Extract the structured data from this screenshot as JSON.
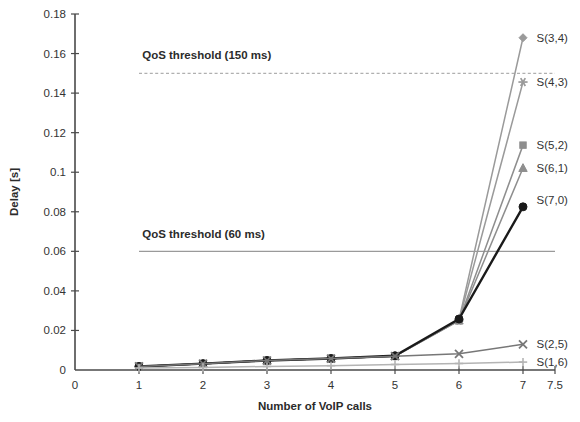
{
  "chart_data": {
    "type": "line",
    "title": "",
    "xlabel": "Number of VoIP calls",
    "ylabel": "Delay [s]",
    "x": [
      1,
      2,
      3,
      4,
      5,
      6,
      7
    ],
    "xlim": [
      0,
      7.5
    ],
    "ylim": [
      0,
      0.18
    ],
    "xticks": [
      "0",
      "1",
      "2",
      "3",
      "4",
      "5",
      "6",
      "7",
      "7.5"
    ],
    "xtick_values": [
      0,
      1,
      2,
      3,
      4,
      5,
      6,
      7,
      7.5
    ],
    "yticks": [
      "0",
      "0.02",
      "0.04",
      "0.06",
      "0.08",
      "0.1",
      "0.12",
      "0.14",
      "0.16",
      "0.18"
    ],
    "ytick_values": [
      0,
      0.02,
      0.04,
      0.06,
      0.08,
      0.1,
      0.12,
      0.14,
      0.16,
      0.18
    ],
    "grid": false,
    "legend_position": "right-inline-labels",
    "series": [
      {
        "name": "S(3,4)",
        "marker": "diamond",
        "color": "#9a9a9a",
        "label_x": 7.15,
        "label_y": 0.168,
        "values": [
          0.0018,
          0.0032,
          0.0048,
          0.0058,
          0.007,
          0.0255,
          0.168
        ]
      },
      {
        "name": "S(4,3)",
        "marker": "star",
        "color": "#9a9a9a",
        "label_x": 7.15,
        "label_y": 0.1456,
        "values": [
          0.0018,
          0.0032,
          0.0048,
          0.0058,
          0.007,
          0.025,
          0.1456
        ]
      },
      {
        "name": "S(5,2)",
        "marker": "square",
        "color": "#8e8e8e",
        "label_x": 7.15,
        "label_y": 0.1137,
        "values": [
          0.0018,
          0.0032,
          0.0048,
          0.0058,
          0.007,
          0.025,
          0.1137
        ]
      },
      {
        "name": "S(6,1)",
        "marker": "triangle",
        "color": "#8e8e8e",
        "label_x": 7.15,
        "label_y": 0.1021,
        "values": [
          0.0018,
          0.0032,
          0.0048,
          0.0058,
          0.007,
          0.025,
          0.1021
        ]
      },
      {
        "name": "S(7,0)",
        "marker": "circle",
        "color": "#1a1a1a",
        "label_x": 7.15,
        "label_y": 0.086,
        "values": [
          0.0018,
          0.0032,
          0.0048,
          0.0058,
          0.0072,
          0.0258,
          0.0825
        ]
      },
      {
        "name": "S(2,5)",
        "marker": "cross",
        "color": "#777777",
        "label_x": 7.15,
        "label_y": 0.013,
        "values": [
          0.0018,
          0.0032,
          0.0048,
          0.0058,
          0.007,
          0.0082,
          0.013
        ]
      },
      {
        "name": "S(1,6)",
        "marker": "plus",
        "color": "#b4b4b4",
        "label_x": 7.15,
        "label_y": 0.004,
        "values": [
          0.001,
          0.0013,
          0.0018,
          0.0022,
          0.0028,
          0.0033,
          0.004
        ]
      }
    ],
    "annotations": [
      {
        "name": "qos-threshold-150",
        "text": "QoS threshold (150 ms)",
        "value": 0.15,
        "line_style": "dashed",
        "color": "#b0b0b0",
        "text_x": 1.05,
        "text_y": 0.157,
        "line_x0": 1.0,
        "line_x1": 7.5
      },
      {
        "name": "qos-threshold-60",
        "text": "QoS threshold (60 ms)",
        "value": 0.06,
        "line_style": "solid",
        "color": "#9a9a9a",
        "text_x": 1.05,
        "text_y": 0.0665,
        "line_x0": 1.0,
        "line_x1": 7.5
      }
    ]
  }
}
